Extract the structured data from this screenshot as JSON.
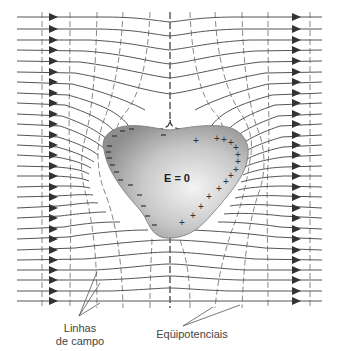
{
  "figure": {
    "title": "",
    "conductor_label": "E = 0",
    "field_lines_label_line1": "Linhas",
    "field_lines_label_line2": "de campo",
    "equipotentials_label": "Eqüipotenciais",
    "negative_charge_symbol": "−",
    "positive_charge_symbol": "+",
    "colors": {
      "field_line": "#555555",
      "equipotential": "#777777",
      "center_equipotential": "#444444",
      "conductor_fill_light": "#f2f2f2",
      "conductor_fill_dark": "#8a8a8a",
      "arrow": "#333333",
      "text": "#444444"
    },
    "field_line_count": 27,
    "left_arrow_x": 52,
    "right_arrow_x": 295
  }
}
